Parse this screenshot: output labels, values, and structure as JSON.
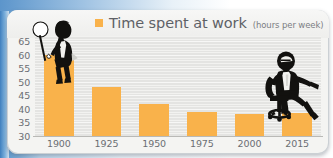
{
  "legend": {
    "label": "Time spent at work",
    "units": "(hours per week)",
    "swatch_color": "#f9b24b"
  },
  "colors": {
    "bar": "#f9b24b",
    "plot_background": "#e4e4e2",
    "card_background": "#f4f4f2",
    "axis_text": "#6b6e73",
    "backdrop_blue": "#4a87c4"
  },
  "figures": {
    "left": "seated-man-with-lamp-icon",
    "right": "businessman-in-office-chair-icon"
  },
  "chart_data": {
    "type": "bar",
    "title": "Time spent at work",
    "subtitle": "(hours per week)",
    "xlabel": "",
    "ylabel": "",
    "categories": [
      "1900",
      "1925",
      "1950",
      "1975",
      "2000",
      "2015"
    ],
    "values": [
      60,
      48,
      42,
      39,
      38,
      38.5
    ],
    "ylim": [
      30,
      67
    ],
    "yticks": [
      30,
      35,
      40,
      45,
      50,
      55,
      60,
      65
    ],
    "ytick_labels": [
      "30",
      "35",
      "40",
      "45",
      "50",
      "55",
      "60",
      "65"
    ],
    "grid": true,
    "grid_minor_step": 1,
    "legend_position": "top-center",
    "series": [
      {
        "name": "Time spent at work",
        "values": [
          60,
          48,
          42,
          39,
          38,
          38.5
        ]
      }
    ]
  }
}
